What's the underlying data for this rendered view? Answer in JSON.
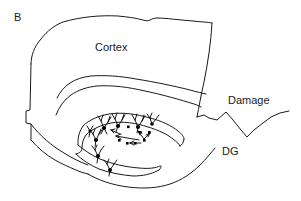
{
  "figure": {
    "panel_label": "B",
    "background_color": "#ffffff",
    "line_color": "#1a1a1a",
    "text_color": "#1a1a1a",
    "type": "line-drawing-schematic"
  },
  "labels": {
    "panel": "B",
    "cortex": "Cortex",
    "damage": "Damage",
    "dg": "DG"
  },
  "label_positions": {
    "panel": {
      "x": 14,
      "y": 18
    },
    "cortex": {
      "x": 95,
      "y": 48
    },
    "damage": {
      "x": 228,
      "y": 101
    },
    "dg": {
      "x": 222,
      "y": 152
    }
  },
  "annotations": {
    "neuron_count": 8,
    "migrating_cell_dots": 7,
    "arrow_count": 5,
    "neuron_symbol": "pyramidal-neuron-glyph",
    "cell_symbol": "filled-square-dot"
  }
}
